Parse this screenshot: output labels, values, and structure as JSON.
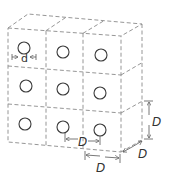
{
  "diagram": {
    "grid": {
      "rows": 3,
      "cols": 3
    },
    "hole_count": 9,
    "labels": {
      "hole_diameter": "d",
      "spacing_horizontal": "D",
      "cell_width": "D",
      "cell_height": "D",
      "cell_depth": "D"
    },
    "colors": {
      "lines": "#8a8a8a",
      "holes": "#3a3a3a",
      "text": "#333333"
    }
  }
}
